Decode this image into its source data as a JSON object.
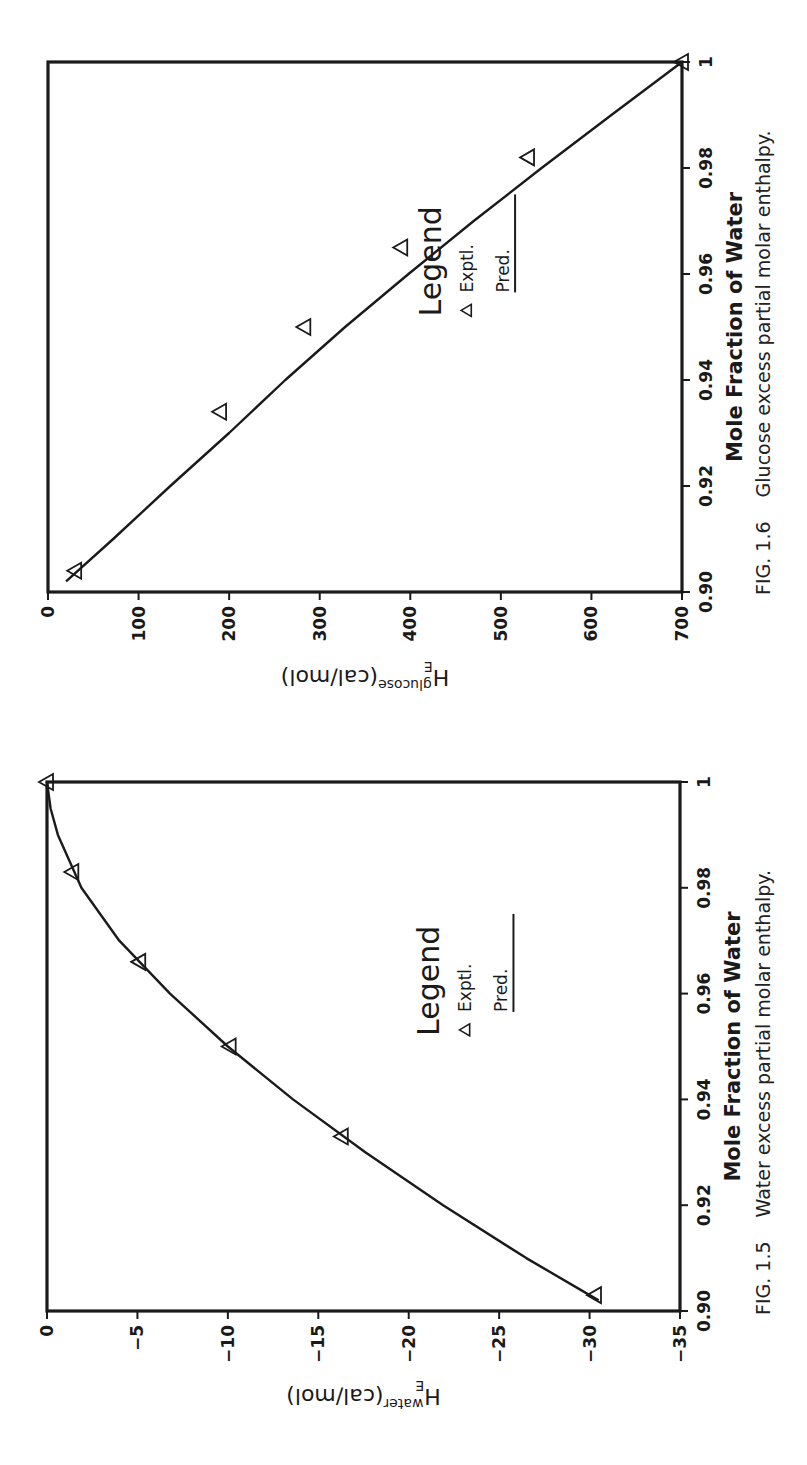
{
  "figures": [
    {
      "id": "fig-1-5",
      "caption_number": "FIG. 1.5",
      "caption_text": "Water excess partial molar enthalpy.",
      "x_label": "Mole Fraction of Water",
      "y_label": {
        "base": "H",
        "sub": "E",
        "sup": "water",
        "unit": "(cal/mol)"
      },
      "x_ticks": [
        "0.90",
        "0.92",
        "0.94",
        "0.96",
        "0.98",
        "1"
      ],
      "y_ticks": [
        "0",
        "−5",
        "−10",
        "−15",
        "−20",
        "−25",
        "−30",
        "−35"
      ],
      "legend": {
        "title": "Legend",
        "marker_label": "Exptl.",
        "line_label": "Pred."
      }
    },
    {
      "id": "fig-1-6",
      "caption_number": "FIG. 1.6",
      "caption_text": "Glucose excess partial molar enthalpy.",
      "x_label": "Mole Fraction of Water",
      "y_label": {
        "base": "H",
        "sub": "E",
        "sup": "glucose",
        "unit": "(cal/mol)"
      },
      "x_ticks": [
        "0.90",
        "0.92",
        "0.94",
        "0.96",
        "0.98",
        "1"
      ],
      "y_ticks": [
        "700",
        "600",
        "500",
        "400",
        "300",
        "200",
        "100",
        "0"
      ],
      "legend": {
        "title": "Legend",
        "marker_label": "Exptl.",
        "line_label": "Pred."
      }
    }
  ],
  "chart_data": [
    {
      "type": "line",
      "title": "FIG. 1.5 Water excess partial molar enthalpy.",
      "xlabel": "Mole Fraction of Water",
      "ylabel": "H^E_water (cal/mol)",
      "xlim": [
        0.9,
        1.0
      ],
      "ylim": [
        -35,
        0
      ],
      "x_ticks": [
        0.9,
        0.92,
        0.94,
        0.96,
        0.98,
        1.0
      ],
      "y_ticks": [
        0,
        -5,
        -10,
        -15,
        -20,
        -25,
        -30,
        -35
      ],
      "grid": false,
      "legend_position": "center-right",
      "series": [
        {
          "name": "Exptl.",
          "style": "triangle-markers",
          "x": [
            0.903,
            0.933,
            0.95,
            0.966,
            0.983,
            1.0
          ],
          "y": [
            -30.3,
            -16.3,
            -10.1,
            -5.1,
            -1.4,
            0.0
          ]
        },
        {
          "name": "Pred.",
          "style": "solid-line",
          "x": [
            0.902,
            0.91,
            0.92,
            0.93,
            0.94,
            0.95,
            0.96,
            0.97,
            0.98,
            0.99,
            0.995,
            1.0
          ],
          "y": [
            -30.5,
            -26.5,
            -21.9,
            -17.6,
            -13.6,
            -10.0,
            -6.8,
            -4.0,
            -1.9,
            -0.6,
            -0.2,
            0.0
          ]
        }
      ]
    },
    {
      "type": "line",
      "title": "FIG. 1.6 Glucose excess partial molar enthalpy.",
      "xlabel": "Mole Fraction of Water",
      "ylabel": "H^E_glucose (cal/mol)",
      "xlim": [
        0.9,
        1.0
      ],
      "ylim": [
        0,
        700
      ],
      "x_ticks": [
        0.9,
        0.92,
        0.94,
        0.96,
        0.98,
        1.0
      ],
      "y_ticks": [
        0,
        100,
        200,
        300,
        400,
        500,
        600,
        700
      ],
      "grid": false,
      "legend_position": "center-right",
      "series": [
        {
          "name": "Exptl.",
          "style": "triangle-markers",
          "x": [
            0.904,
            0.934,
            0.95,
            0.965,
            0.982,
            1.0
          ],
          "y": [
            670,
            510,
            417,
            310,
            170,
            0
          ]
        },
        {
          "name": "Pred.",
          "style": "solid-line",
          "x": [
            0.902,
            0.91,
            0.92,
            0.93,
            0.94,
            0.95,
            0.96,
            0.97,
            0.98,
            0.99,
            1.0
          ],
          "y": [
            680,
            628,
            565,
            500,
            438,
            372,
            302,
            230,
            155,
            78,
            0
          ]
        }
      ]
    }
  ]
}
